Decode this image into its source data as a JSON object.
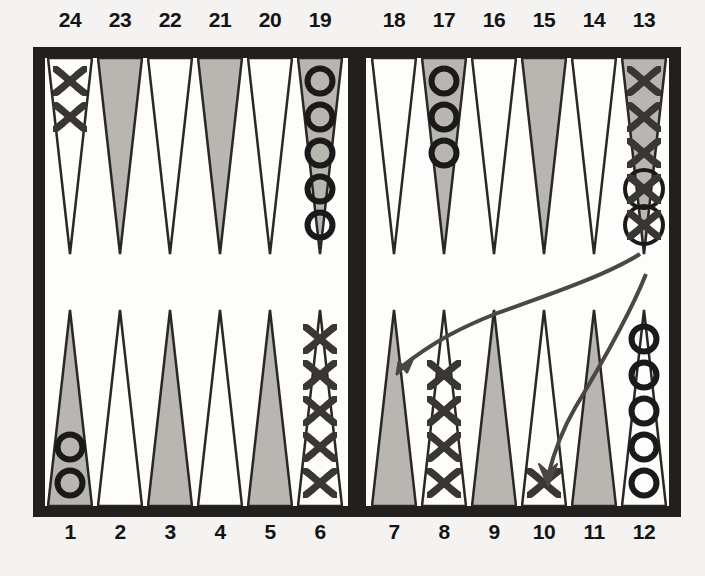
{
  "colors": {
    "board_frame": "#231f1e",
    "playfield": "#fdfdfb",
    "point_shaded": "#b9b6b2",
    "point_light": "#fdfdfb",
    "checker_x": "#3a3633",
    "checker_o": "#1a1a1a",
    "arrow": "#4a4744",
    "label_text": "#141414"
  },
  "labels": {
    "top": [
      "24",
      "23",
      "22",
      "21",
      "20",
      "19",
      "18",
      "17",
      "16",
      "15",
      "14",
      "13"
    ],
    "bottom": [
      "1",
      "2",
      "3",
      "4",
      "5",
      "6",
      "7",
      "8",
      "9",
      "10",
      "11",
      "12"
    ]
  },
  "points": [
    {
      "number": "24",
      "quadrant": "top-left",
      "slot": 0,
      "shade": "light",
      "checker": "X",
      "count": 2,
      "highlighted": 0
    },
    {
      "number": "23",
      "quadrant": "top-left",
      "slot": 1,
      "shade": "shaded",
      "checker": "",
      "count": 0,
      "highlighted": 0
    },
    {
      "number": "22",
      "quadrant": "top-left",
      "slot": 2,
      "shade": "light",
      "checker": "",
      "count": 0,
      "highlighted": 0
    },
    {
      "number": "21",
      "quadrant": "top-left",
      "slot": 3,
      "shade": "shaded",
      "checker": "",
      "count": 0,
      "highlighted": 0
    },
    {
      "number": "20",
      "quadrant": "top-left",
      "slot": 4,
      "shade": "light",
      "checker": "",
      "count": 0,
      "highlighted": 0
    },
    {
      "number": "19",
      "quadrant": "top-left",
      "slot": 5,
      "shade": "shaded",
      "checker": "O",
      "count": 5,
      "highlighted": 0
    },
    {
      "number": "18",
      "quadrant": "top-right",
      "slot": 0,
      "shade": "light",
      "checker": "",
      "count": 0,
      "highlighted": 0
    },
    {
      "number": "17",
      "quadrant": "top-right",
      "slot": 1,
      "shade": "shaded",
      "checker": "O",
      "count": 3,
      "highlighted": 0
    },
    {
      "number": "16",
      "quadrant": "top-right",
      "slot": 2,
      "shade": "light",
      "checker": "",
      "count": 0,
      "highlighted": 0
    },
    {
      "number": "15",
      "quadrant": "top-right",
      "slot": 3,
      "shade": "shaded",
      "checker": "",
      "count": 0,
      "highlighted": 0
    },
    {
      "number": "14",
      "quadrant": "top-right",
      "slot": 4,
      "shade": "light",
      "checker": "",
      "count": 0,
      "highlighted": 0
    },
    {
      "number": "13",
      "quadrant": "top-right",
      "slot": 5,
      "shade": "shaded",
      "checker": "X",
      "count": 5,
      "highlighted": 2
    },
    {
      "number": "1",
      "quadrant": "bottom-left",
      "slot": 0,
      "shade": "shaded",
      "checker": "O",
      "count": 2,
      "highlighted": 0
    },
    {
      "number": "2",
      "quadrant": "bottom-left",
      "slot": 1,
      "shade": "light",
      "checker": "",
      "count": 0,
      "highlighted": 0
    },
    {
      "number": "3",
      "quadrant": "bottom-left",
      "slot": 2,
      "shade": "shaded",
      "checker": "",
      "count": 0,
      "highlighted": 0
    },
    {
      "number": "4",
      "quadrant": "bottom-left",
      "slot": 3,
      "shade": "light",
      "checker": "",
      "count": 0,
      "highlighted": 0
    },
    {
      "number": "5",
      "quadrant": "bottom-left",
      "slot": 4,
      "shade": "shaded",
      "checker": "",
      "count": 0,
      "highlighted": 0
    },
    {
      "number": "6",
      "quadrant": "bottom-left",
      "slot": 5,
      "shade": "light",
      "checker": "X",
      "count": 5,
      "highlighted": 0
    },
    {
      "number": "7",
      "quadrant": "bottom-right",
      "slot": 0,
      "shade": "shaded",
      "checker": "",
      "count": 0,
      "highlighted": 0
    },
    {
      "number": "8",
      "quadrant": "bottom-right",
      "slot": 1,
      "shade": "light",
      "checker": "X",
      "count": 4,
      "highlighted": 0
    },
    {
      "number": "9",
      "quadrant": "bottom-right",
      "slot": 2,
      "shade": "shaded",
      "checker": "",
      "count": 0,
      "highlighted": 0
    },
    {
      "number": "10",
      "quadrant": "bottom-right",
      "slot": 3,
      "shade": "light",
      "checker": "X",
      "count": 1,
      "highlighted": 0
    },
    {
      "number": "11",
      "quadrant": "bottom-right",
      "slot": 4,
      "shade": "shaded",
      "checker": "",
      "count": 0,
      "highlighted": 0
    },
    {
      "number": "12",
      "quadrant": "bottom-right",
      "slot": 5,
      "shade": "light",
      "checker": "O",
      "count": 5,
      "highlighted": 0
    }
  ],
  "moves": [
    {
      "from": "13",
      "to": "8",
      "marker": "arrow"
    },
    {
      "from": "13",
      "to": "10",
      "marker": "arrow"
    }
  ]
}
